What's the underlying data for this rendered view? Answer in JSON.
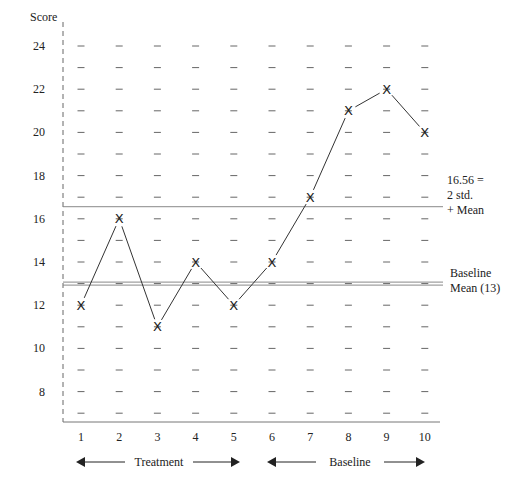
{
  "chart_data": {
    "type": "line",
    "title": "",
    "xlabel": "",
    "ylabel": "Score",
    "x": [
      1,
      2,
      3,
      4,
      5,
      6,
      7,
      8,
      9,
      10
    ],
    "series": [
      {
        "name": "Score",
        "marker": "X",
        "values": [
          12,
          16,
          11,
          14,
          12,
          14,
          17,
          21,
          22,
          20
        ]
      }
    ],
    "yticks": [
      8,
      10,
      12,
      14,
      16,
      18,
      20,
      22,
      24
    ],
    "xticks": [
      1,
      2,
      3,
      4,
      5,
      6,
      7,
      8,
      9,
      10
    ],
    "ylim": [
      6.5,
      24.5
    ],
    "xlim": [
      0.5,
      10.6
    ],
    "grid": "dashes at every integer score per column",
    "reference_lines": [
      {
        "value": 16.56,
        "label": "16.56 = 2 std. + Mean",
        "style": "single"
      },
      {
        "value": 13,
        "label": "Baseline Mean (13)",
        "style": "double"
      }
    ],
    "phases": [
      {
        "label": "Treatment",
        "from": 1,
        "to": 5
      },
      {
        "label": "Baseline",
        "from": 6,
        "to": 10
      }
    ]
  },
  "labels": {
    "y_axis_title": "Score",
    "upper_line_note": [
      "16.56 =",
      "2 std.",
      "+ Mean"
    ],
    "mean_line_note": [
      "Baseline",
      "Mean (13)"
    ],
    "phase_treatment": "Treatment",
    "phase_baseline": "Baseline"
  },
  "colors": {
    "ink": "#222222",
    "grid": "#555555",
    "reference": "#888888"
  }
}
